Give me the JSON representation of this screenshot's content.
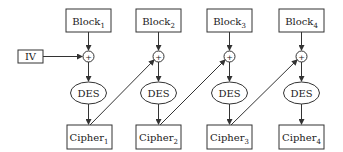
{
  "diagram": {
    "iv_label": "IV",
    "xor_symbol": "+",
    "columns": [
      {
        "block": "Block",
        "block_sub": "1",
        "cipher": "Cipher",
        "cipher_sub": "1",
        "des": "DES",
        "cx": 88
      },
      {
        "block": "Block",
        "block_sub": "2",
        "cipher": "Cipher",
        "cipher_sub": "2",
        "des": "DES",
        "cx": 158
      },
      {
        "block": "Block",
        "block_sub": "3",
        "cipher": "Cipher",
        "cipher_sub": "3",
        "des": "DES",
        "cx": 229
      },
      {
        "block": "Block",
        "block_sub": "4",
        "cipher": "Cipher",
        "cipher_sub": "4",
        "des": "DES",
        "cx": 301
      }
    ],
    "colors": {
      "stroke": "#333333",
      "text": "#222222",
      "background": "#ffffff"
    }
  }
}
